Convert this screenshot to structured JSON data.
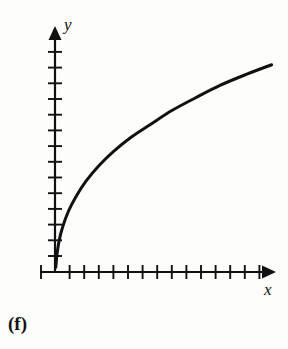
{
  "figure": {
    "panel_label": "(f)",
    "background_color": "#fdfdfc",
    "ink_color": "#111111",
    "width": 288,
    "height": 349
  },
  "chart_data": {
    "type": "line",
    "title": "",
    "subtitle": "",
    "xlabel": "x",
    "ylabel": "y",
    "panel": "(f)",
    "curve_shape": "logarithmic",
    "grid": false,
    "legend": null,
    "legend_position": "none",
    "axis_labels_on_ticks": false,
    "ticks_labeled": false,
    "xlim": [
      0,
      16
    ],
    "ylim": [
      0,
      16
    ],
    "x_tick_count": 16,
    "y_tick_count": 15,
    "x_tick_values": [
      -1,
      1,
      2,
      3,
      4,
      5,
      6,
      7,
      8,
      9,
      10,
      11,
      12,
      13,
      14,
      15
    ],
    "y_tick_values": [
      1,
      2,
      3,
      4,
      5,
      6,
      7,
      8,
      9,
      10,
      11,
      12,
      13,
      14,
      15
    ],
    "series": [
      {
        "name": "curve",
        "x": [
          0.02,
          0.1,
          0.25,
          0.5,
          0.9,
          1.4,
          2.1,
          3.0,
          4.0,
          5.2,
          6.5,
          8.0,
          9.6,
          11.3,
          13.1,
          14.8
        ],
        "y": [
          0.3,
          1.1,
          2.0,
          2.9,
          3.9,
          4.8,
          5.8,
          6.8,
          7.7,
          8.6,
          9.4,
          10.3,
          11.1,
          11.9,
          12.6,
          13.2
        ]
      }
    ],
    "axes": {
      "x_axis_arrow": true,
      "y_axis_arrow": true,
      "origin_label": "",
      "x_axis_extends_left_of_origin": true
    }
  },
  "icons": {
    "y_arrow": "arrow-up-icon",
    "x_arrow": "arrow-right-icon"
  }
}
